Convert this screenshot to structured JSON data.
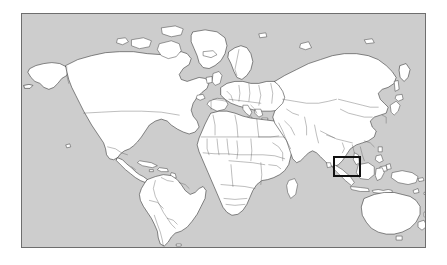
{
  "page": {
    "background_color": "#ffffff",
    "width": 447,
    "height": 265,
    "title": "",
    "caption": ""
  },
  "map": {
    "type": "world-locator-map",
    "projection": "equirectangular",
    "frame": {
      "x": 21,
      "y": 13,
      "width": 405,
      "height": 235,
      "border_color": "#6e6e6e",
      "border_width": 1
    },
    "ocean_color": "#cdcdcd",
    "land_color": "#ffffff",
    "coastline_color": "#2b2b2b",
    "country_border_color": "#5a5a5a",
    "shows_country_borders": true,
    "graticule": false,
    "labels": [],
    "legend": null
  },
  "highlight": {
    "label": "",
    "region_name": "indonesia-southeast-asia",
    "shape": "rectangle",
    "color": "#111111",
    "line_width": 2,
    "fill": "none",
    "x": 332,
    "y": 155,
    "width": 28,
    "height": 21,
    "approx_bounds_deg": {
      "west": 95,
      "east": 120,
      "south": -11,
      "north": 8
    }
  },
  "continents": [
    "North America",
    "South America",
    "Europe",
    "Africa",
    "Asia",
    "Australia",
    "Antarctica (not shown)"
  ]
}
